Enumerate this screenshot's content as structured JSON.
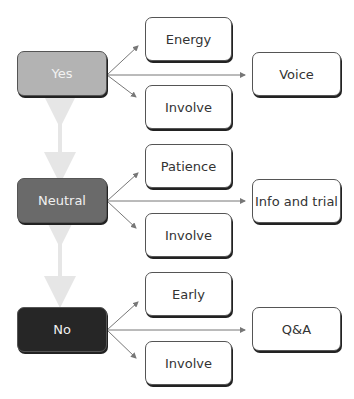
{
  "diagram": {
    "rows": [
      {
        "level": "Yes",
        "top": "Energy",
        "bottom": "Involve",
        "result": "Voice",
        "color": "#b3b3b3"
      },
      {
        "level": "Neutral",
        "top": "Patience",
        "bottom": "Involve",
        "result": "Info and trial",
        "color": "#6a6a6a"
      },
      {
        "level": "No",
        "top": "Early",
        "bottom": "Involve",
        "result": "Q&A",
        "color": "#262626"
      }
    ],
    "connector_color": "#e6e6e6",
    "arrow_color": "#777777"
  }
}
